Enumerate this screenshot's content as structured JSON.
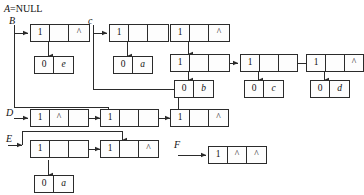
{
  "figure": {
    "kind": "linked-list-diagram",
    "stroke_color": "#2b2b2b",
    "background": "#ffffff"
  },
  "labels": {
    "a_null": "A=NULL",
    "a_name": "A",
    "b": "B",
    "c": "c",
    "d": "D",
    "e": "E",
    "f": "F"
  },
  "marks": {
    "tag_one": "1",
    "tag_zero": "0",
    "nil": "^",
    "empty": ""
  },
  "atoms": {
    "e": "e",
    "a1": "a",
    "b": "b",
    "c": "c",
    "d": "d",
    "a2": "a"
  },
  "nodes": {
    "b_head": {
      "c0": "1",
      "c1": "",
      "c2": "^"
    },
    "b_atom": {
      "c0": "0",
      "c1": "e"
    },
    "c_head": {
      "c0": "1",
      "c1": "",
      "c2": ""
    },
    "c_atom": {
      "c0": "0",
      "c1": "a"
    },
    "c_n2": {
      "c0": "1",
      "c1": "",
      "c2": "^"
    },
    "c_n3": {
      "c0": "1",
      "c1": "",
      "c2": ""
    },
    "b_atom2": {
      "c0": "0",
      "c1": "b"
    },
    "c_n4": {
      "c0": "1",
      "c1": "",
      "c2": ""
    },
    "c_atom3": {
      "c0": "0",
      "c1": "c"
    },
    "c_n5": {
      "c0": "1",
      "c1": "",
      "c2": "^"
    },
    "c_atom4": {
      "c0": "0",
      "c1": "d"
    },
    "d_n1": {
      "c0": "1",
      "c1": "^",
      "c2": ""
    },
    "d_n2": {
      "c0": "1",
      "c1": "",
      "c2": ""
    },
    "d_n3": {
      "c0": "1",
      "c1": "",
      "c2": "^"
    },
    "e_n1": {
      "c0": "1",
      "c1": "",
      "c2": ""
    },
    "e_n2": {
      "c0": "1",
      "c1": "",
      "c2": "^"
    },
    "e_atom": {
      "c0": "0",
      "c1": "a"
    },
    "f_n1": {
      "c0": "1",
      "c1": "^",
      "c2": "^"
    }
  }
}
